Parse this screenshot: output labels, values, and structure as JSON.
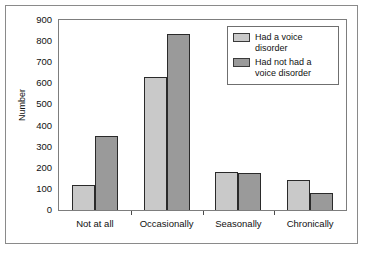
{
  "chart_data": {
    "type": "bar",
    "title": "",
    "xlabel": "",
    "ylabel": "Number",
    "ylim": [
      0,
      900
    ],
    "yticks": [
      0,
      100,
      200,
      300,
      400,
      500,
      600,
      700,
      800,
      900
    ],
    "grid": false,
    "legend_position": "upper-right-inside",
    "categories": [
      "Not at all",
      "Occasionally",
      "Seasonally",
      "Chronically"
    ],
    "series": [
      {
        "name": "Had a voice disorder",
        "color": "#c9c9c9",
        "values": [
          120,
          630,
          178,
          140
        ]
      },
      {
        "name": "Had not had a voice disorder",
        "color": "#9a9a9a",
        "values": [
          350,
          835,
          175,
          80
        ]
      }
    ]
  },
  "legend": {
    "entries": [
      {
        "label": "Had a voice disorder",
        "swatch": "light"
      },
      {
        "label": "Had not had a voice disorder",
        "swatch": "dark"
      }
    ]
  },
  "colors": {
    "series_light": "#c9c9c9",
    "series_dark": "#9a9a9a",
    "bar_outline": "#2a2a2a",
    "axis": "#4a4a4a",
    "frame": "#7d7d7d",
    "text": "#111111",
    "background": "#ffffff"
  }
}
